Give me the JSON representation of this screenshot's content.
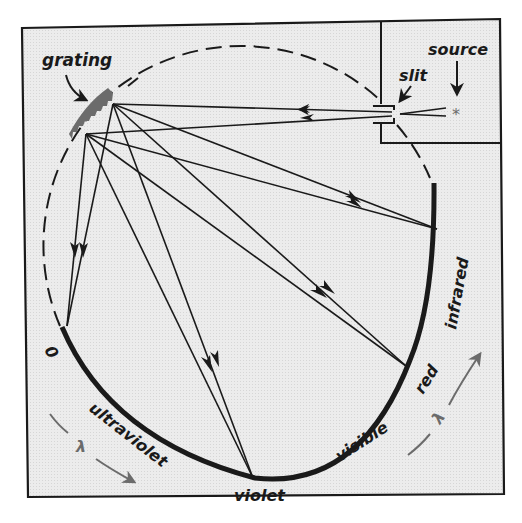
{
  "figure": {
    "background_color": "#e9e9e9",
    "line_color": "#1a1a1a",
    "accent_gray": "#6b6b6b"
  },
  "labels": {
    "grating": "grating",
    "slit": "slit",
    "source": "source",
    "zero_order": "0",
    "ultraviolet": "ultraviolet",
    "violet": "violet",
    "visible": "visible",
    "red": "red",
    "infrared": "infrared",
    "lambda_left": "λ",
    "lambda_right": "λ"
  },
  "components": {
    "source_marker": "*",
    "rays": [
      {
        "from": "slit",
        "to": "grating-upper"
      },
      {
        "from": "slit",
        "to": "grating-lower"
      },
      {
        "from": "grating",
        "to": "zero-order"
      },
      {
        "from": "grating",
        "to": "violet"
      },
      {
        "from": "grating",
        "to": "red"
      },
      {
        "from": "grating",
        "to": "infrared"
      }
    ]
  }
}
